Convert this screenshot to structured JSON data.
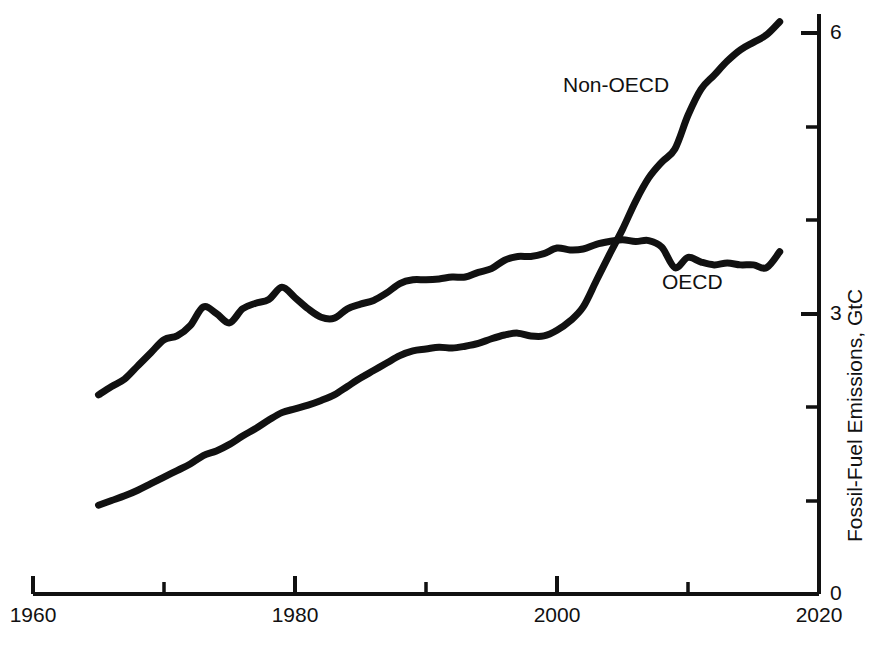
{
  "chart_data": {
    "type": "line",
    "title": "",
    "xlabel": "",
    "ylabel": "Fossil-Fuel Emissions, GtC",
    "xlim": [
      1960,
      2020
    ],
    "ylim": [
      0,
      6.4
    ],
    "grid": false,
    "legend_position": "inline-annotations",
    "x_major_ticks": [
      1960,
      1980,
      2000,
      2020
    ],
    "x_minor_ticks": [
      1970,
      1990,
      2010
    ],
    "x_tick_labels": [
      "1960",
      "1980",
      "2000",
      "2020"
    ],
    "y_major_ticks": [
      0,
      3,
      6
    ],
    "y_minor_ticks": [
      1,
      2,
      4,
      5
    ],
    "y_tick_labels": [
      "0",
      "3",
      "6"
    ],
    "line_color": "#111111",
    "line_width": 7,
    "series": [
      {
        "name": "OECD",
        "label": "OECD",
        "x": [
          1965,
          1966,
          1967,
          1968,
          1969,
          1970,
          1971,
          1972,
          1973,
          1974,
          1975,
          1976,
          1977,
          1978,
          1979,
          1980,
          1981,
          1982,
          1983,
          1984,
          1985,
          1986,
          1987,
          1988,
          1989,
          1990,
          1991,
          1992,
          1993,
          1994,
          1995,
          1996,
          1997,
          1998,
          1999,
          2000,
          2001,
          2002,
          2003,
          2004,
          2005,
          2006,
          2007,
          2008,
          2009,
          2010,
          2011,
          2012,
          2013,
          2014,
          2015,
          2016,
          2017
        ],
        "values": [
          2.13,
          2.22,
          2.3,
          2.44,
          2.58,
          2.72,
          2.76,
          2.87,
          3.07,
          3.0,
          2.9,
          3.05,
          3.11,
          3.15,
          3.28,
          3.17,
          3.05,
          2.96,
          2.95,
          3.05,
          3.1,
          3.14,
          3.22,
          3.32,
          3.36,
          3.36,
          3.37,
          3.39,
          3.39,
          3.44,
          3.48,
          3.57,
          3.61,
          3.61,
          3.64,
          3.7,
          3.68,
          3.69,
          3.74,
          3.77,
          3.79,
          3.77,
          3.78,
          3.71,
          3.49,
          3.6,
          3.55,
          3.52,
          3.54,
          3.52,
          3.52,
          3.49,
          3.66
        ],
        "start_value": 2.13,
        "end_value": 3.66,
        "peak_value": 3.79,
        "peak_year": 2005
      },
      {
        "name": "Non-OECD",
        "label": "Non-OECD",
        "x": [
          1965,
          1966,
          1967,
          1968,
          1969,
          1970,
          1971,
          1972,
          1973,
          1974,
          1975,
          1976,
          1977,
          1978,
          1979,
          1980,
          1981,
          1982,
          1983,
          1984,
          1985,
          1986,
          1987,
          1988,
          1989,
          1990,
          1991,
          1992,
          1993,
          1994,
          1995,
          1996,
          1997,
          1998,
          1999,
          2000,
          2001,
          2002,
          2003,
          2004,
          2005,
          2006,
          2007,
          2008,
          2009,
          2010,
          2011,
          2012,
          2013,
          2014,
          2015,
          2016,
          2017
        ],
        "values": [
          0.95,
          1.0,
          1.05,
          1.11,
          1.18,
          1.25,
          1.32,
          1.39,
          1.48,
          1.53,
          1.6,
          1.69,
          1.77,
          1.86,
          1.94,
          1.98,
          2.02,
          2.07,
          2.13,
          2.22,
          2.31,
          2.39,
          2.47,
          2.55,
          2.6,
          2.62,
          2.64,
          2.63,
          2.65,
          2.68,
          2.73,
          2.77,
          2.79,
          2.76,
          2.76,
          2.82,
          2.92,
          3.07,
          3.35,
          3.63,
          3.9,
          4.2,
          4.45,
          4.62,
          4.76,
          5.12,
          5.4,
          5.55,
          5.7,
          5.82,
          5.9,
          5.98,
          6.12
        ],
        "start_value": 0.95,
        "end_value": 6.12,
        "crossover_year": 2005,
        "crossover_value": 3.97
      }
    ],
    "annotations": [
      {
        "text": "Non-OECD",
        "x": 1999.5,
        "y": 5.5
      },
      {
        "text": "OECD",
        "x": 2007.5,
        "y": 3.25
      }
    ]
  },
  "axis": {
    "y_title": "Fossil-Fuel Emissions, GtC",
    "x_labels": [
      "1960",
      "1980",
      "2000",
      "2020"
    ],
    "y_labels": [
      "6",
      "3",
      "0"
    ]
  }
}
